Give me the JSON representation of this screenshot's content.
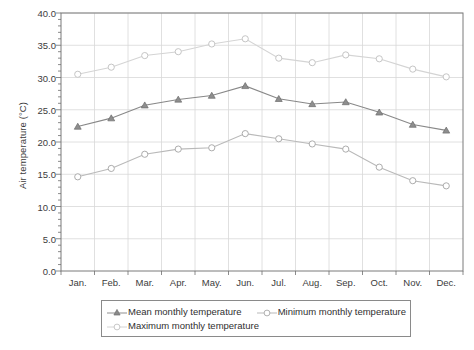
{
  "chart_data": {
    "type": "line",
    "title": "",
    "xlabel": "",
    "ylabel": "Air temperature (°C)",
    "categories": [
      "Jan.",
      "Feb.",
      "Mar.",
      "Apr.",
      "May.",
      "Jun.",
      "Jul.",
      "Aug.",
      "Sep.",
      "Oct.",
      "Nov.",
      "Dec."
    ],
    "ylim": [
      0.0,
      40.0
    ],
    "yticks": [
      "0.0",
      "5.0",
      "10.0",
      "15.0",
      "20.0",
      "25.0",
      "30.0",
      "35.0",
      "40.0"
    ],
    "ytick_values": [
      0,
      5,
      10,
      15,
      20,
      25,
      30,
      35,
      40
    ],
    "grid": true,
    "legend_position": "bottom",
    "series": [
      {
        "name": "Mean monthly temperature",
        "marker": "filled-triangle",
        "color": "#888888",
        "values": [
          22.4,
          23.7,
          25.7,
          26.6,
          27.2,
          28.7,
          26.7,
          25.9,
          26.2,
          24.6,
          22.7,
          21.8
        ]
      },
      {
        "name": "Minimum monthly temperature",
        "marker": "open-circle",
        "color": "#b9b9b9",
        "values": [
          14.6,
          15.9,
          18.1,
          18.9,
          19.1,
          21.3,
          20.5,
          19.7,
          18.9,
          16.1,
          14.0,
          13.2
        ]
      },
      {
        "name": "Maximum monthly temperature",
        "marker": "open-circle",
        "color": "#d4d4d4",
        "values": [
          30.5,
          31.6,
          33.4,
          34.0,
          35.2,
          36.0,
          33.0,
          32.3,
          33.5,
          32.9,
          31.3,
          30.1
        ]
      }
    ]
  },
  "legend": {
    "items": [
      "Mean monthly temperature",
      "Minimum monthly temperature",
      "Maximum monthly temperature"
    ]
  },
  "axis": {
    "y_title": "Air temperature (°C)"
  }
}
